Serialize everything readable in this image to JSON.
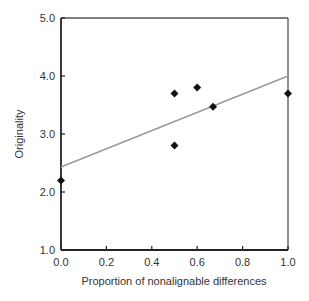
{
  "chart_data": {
    "type": "scatter",
    "title": "",
    "xlabel": "Proportion of nonalignable differences",
    "ylabel": "Originality",
    "xlim": [
      0.0,
      1.0
    ],
    "ylim": [
      1.0,
      5.0
    ],
    "x_ticks": [
      "0.0",
      "0.2",
      "0.4",
      "0.6",
      "0.8",
      "1.0"
    ],
    "y_ticks": [
      "1.0",
      "2.0",
      "3.0",
      "4.0",
      "5.0"
    ],
    "grid": false,
    "legend": null,
    "series": [
      {
        "name": "data",
        "marker": "diamond",
        "color": "#111111",
        "points": [
          {
            "x": 0.0,
            "y": 2.2
          },
          {
            "x": 0.5,
            "y": 3.7
          },
          {
            "x": 0.5,
            "y": 2.8
          },
          {
            "x": 0.6,
            "y": 3.8
          },
          {
            "x": 0.67,
            "y": 3.47
          },
          {
            "x": 1.0,
            "y": 3.7
          }
        ]
      }
    ],
    "trendline": {
      "type": "linear",
      "color": "#999999",
      "start": {
        "x": 0.0,
        "y": 2.43
      },
      "end": {
        "x": 1.0,
        "y": 4.0
      }
    }
  }
}
